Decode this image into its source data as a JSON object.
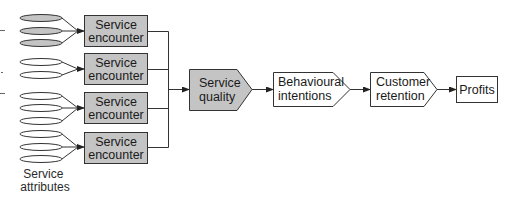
{
  "diagram": {
    "colors": {
      "shaded_fill": "#c4c4c4",
      "plain_fill": "#ffffff",
      "stroke": "#333333"
    },
    "attribute_groups": [
      {
        "count": 3,
        "shaded": true
      },
      {
        "count": 2,
        "shaded": false
      },
      {
        "count": 3,
        "shaded": false
      },
      {
        "count": 3,
        "shaded": false
      }
    ],
    "attributes_caption": {
      "line1": "Service",
      "line2": "attributes"
    },
    "encounters": [
      {
        "line1": "Service",
        "line2": "encounter"
      },
      {
        "line1": "Service",
        "line2": "encounter"
      },
      {
        "line1": "Service",
        "line2": "encounter"
      },
      {
        "line1": "Service",
        "line2": "encounter"
      }
    ],
    "chain": [
      {
        "line1": "Service",
        "line2": "quality",
        "shape": "arrow-pentagon",
        "shaded": true
      },
      {
        "line1": "Behavioural",
        "line2": "intentions",
        "shape": "arrow-pentagon",
        "shaded": false
      },
      {
        "line1": "Customer",
        "line2": "retention",
        "shape": "arrow-pentagon",
        "shaded": false
      },
      {
        "line1": "Profits",
        "shape": "rectangle",
        "shaded": false
      }
    ]
  }
}
